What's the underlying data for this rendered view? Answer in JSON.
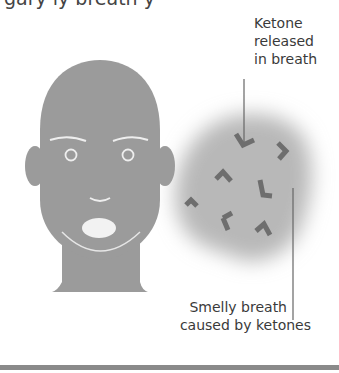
{
  "title_fragment": "gary ly breath y",
  "labels": {
    "ketone_released": [
      "Ketone",
      "released",
      "in breath"
    ],
    "smelly_breath": [
      "Smelly breath",
      "caused by ketones"
    ]
  },
  "colors": {
    "face": "#9a9a9a",
    "face_lines": "#e8e8e8",
    "cloud": "#b5b5b5",
    "ketone_marks": "#6e6e6e",
    "pointer_lines": "#666666",
    "bottom_bar": "#8a8a8a"
  },
  "figure": {
    "ketone_count": 7
  }
}
